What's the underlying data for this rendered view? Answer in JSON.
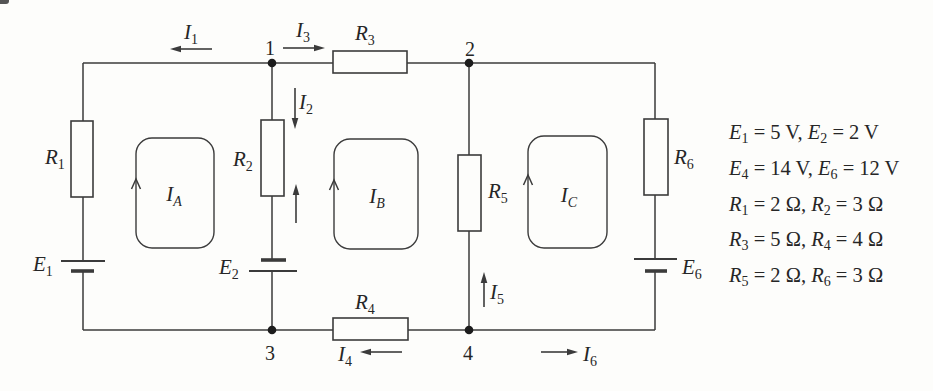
{
  "canvas": {
    "width": 933,
    "height": 391,
    "background": "#fdfdfb",
    "ink_color": "#3b3b3b",
    "text_color": "#262626"
  },
  "diagram_type": "electrical-circuit-mesh-analysis",
  "labels": {
    "nodes": [
      "1",
      "2",
      "3",
      "4"
    ],
    "resistors": [
      {
        "sym": "R",
        "sub": "1"
      },
      {
        "sym": "R",
        "sub": "2"
      },
      {
        "sym": "R",
        "sub": "3"
      },
      {
        "sym": "R",
        "sub": "4"
      },
      {
        "sym": "R",
        "sub": "5"
      },
      {
        "sym": "R",
        "sub": "6"
      }
    ],
    "sources": [
      {
        "sym": "E",
        "sub": "1"
      },
      {
        "sym": "E",
        "sub": "2"
      },
      {
        "sym": "E",
        "sub": "6"
      }
    ],
    "currents": [
      {
        "sym": "I",
        "sub": "1"
      },
      {
        "sym": "I",
        "sub": "2"
      },
      {
        "sym": "I",
        "sub": "3"
      },
      {
        "sym": "I",
        "sub": "4"
      },
      {
        "sym": "I",
        "sub": "5"
      },
      {
        "sym": "I",
        "sub": "6"
      }
    ],
    "loops": [
      {
        "sym": "I",
        "sub": "A"
      },
      {
        "sym": "I",
        "sub": "B"
      },
      {
        "sym": "I",
        "sub": "C"
      }
    ]
  },
  "values": {
    "lines": [
      {
        "sym1": "E",
        "sub1": "1",
        "rest1": " = 5 V, ",
        "sym2": "E",
        "sub2": "2",
        "rest2": " = 2 V"
      },
      {
        "sym1": "E",
        "sub1": "4",
        "rest1": " = 14 V, ",
        "sym2": "E",
        "sub2": "6",
        "rest2": " = 12 V"
      },
      {
        "sym1": "R",
        "sub1": "1",
        "rest1": " = 2 Ω, ",
        "sym2": "R",
        "sub2": "2",
        "rest2": " = 3 Ω"
      },
      {
        "sym1": "R",
        "sub1": "3",
        "rest1": " = 5 Ω, ",
        "sym2": "R",
        "sub2": "4",
        "rest2": " = 4 Ω"
      },
      {
        "sym1": "R",
        "sub1": "5",
        "rest1": " = 2 Ω, ",
        "sym2": "R",
        "sub2": "6",
        "rest2": " = 3 Ω"
      }
    ]
  }
}
